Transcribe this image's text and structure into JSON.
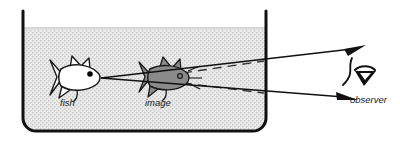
{
  "figure": {
    "type": "physics-ray-diagram",
    "width": 405,
    "height": 143,
    "background_color": "#ffffff"
  },
  "tank": {
    "name": "aquarium-tank",
    "wall_color": "#111111",
    "wall_thickness": 3,
    "water_fill_color": "#e9e9e9",
    "water_texture": "stipple-dots",
    "water_texture_dot_color": "#bdbdbd",
    "left_wall_x": 23,
    "right_wall_x": 266,
    "top_y": 11,
    "bottom_y": 131,
    "corner_radius": 13,
    "water_surface_y": 27
  },
  "objects": [
    {
      "id": "real-fish",
      "label": "fish",
      "label_x": 60,
      "label_y": 105,
      "fill_color": "#ffffff",
      "outline_color": "#1a1a1a",
      "center_x": 72,
      "center_y": 77,
      "facing": "right",
      "eye_color": "#000000"
    },
    {
      "id": "virtual-image-fish",
      "label": "image",
      "label_x": 145,
      "label_y": 105,
      "fill_color": "#8a8a8a",
      "outline_color": "#1a1a1a",
      "center_x": 165,
      "center_y": 77,
      "facing": "right",
      "eye_color": "#3a3a3a"
    }
  ],
  "rays": {
    "name": "light-rays",
    "solid_color": "#111111",
    "dashed_color": "#333333",
    "origin_x": 101,
    "origin_y": 78,
    "solid_rays": [
      {
        "id": "upper-ray",
        "x1": 101,
        "y1": 78,
        "x2": 360,
        "y2": 48
      },
      {
        "id": "lower-ray",
        "x1": 101,
        "y1": 78,
        "x2": 352,
        "y2": 98
      }
    ],
    "dashed_rays": [
      {
        "id": "apparent-ray-upper",
        "x1": 183,
        "y1": 74,
        "x2": 263,
        "y2": 62
      },
      {
        "id": "apparent-ray-lower",
        "x1": 183,
        "y1": 82,
        "x2": 263,
        "y2": 92
      }
    ],
    "arrowheads": [
      {
        "id": "upper-arrowhead",
        "x": 360,
        "y": 48
      },
      {
        "id": "lower-arrowhead",
        "x": 352,
        "y": 98
      }
    ]
  },
  "observer": {
    "name": "observer",
    "label": "observer",
    "label_x": 352,
    "label_y": 103,
    "glyph_x": 360,
    "glyph_y": 72,
    "glyph_color": "#111111",
    "description": "stylized eye and face profile"
  },
  "labels": {
    "fish": "fish",
    "image": "image",
    "observer": "observer"
  }
}
